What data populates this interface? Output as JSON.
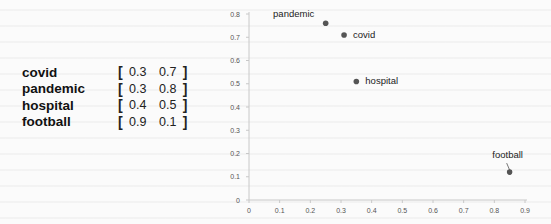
{
  "table": {
    "rows": [
      {
        "word": "covid",
        "open": "[",
        "v1": "0.3",
        "v2": "0.7",
        "close": "]"
      },
      {
        "word": "pandemic",
        "open": "[",
        "v1": "0.3",
        "v2": "0.8",
        "close": "]"
      },
      {
        "word": "hospital",
        "open": "[",
        "v1": "0.4",
        "v2": "0.5",
        "close": "]"
      },
      {
        "word": "football",
        "open": "[",
        "v1": "0.9",
        "v2": "0.1",
        "close": "]"
      }
    ]
  },
  "chart_data": {
    "type": "scatter",
    "title": "",
    "xlabel": "",
    "ylabel": "",
    "xlim": [
      0,
      0.9
    ],
    "ylim": [
      0,
      0.8
    ],
    "grid": false,
    "x_ticks": [
      "0",
      "0.1",
      "0.2",
      "0.3",
      "0.4",
      "0.5",
      "0.6",
      "0.7",
      "0.8",
      "0.9"
    ],
    "y_ticks": [
      "0",
      "0.1",
      "0.2",
      "0.3",
      "0.4",
      "0.5",
      "0.6",
      "0.7",
      "0.8"
    ],
    "points": [
      {
        "label": "pandemic",
        "x": 0.25,
        "y": 0.76
      },
      {
        "label": "covid",
        "x": 0.31,
        "y": 0.71
      },
      {
        "label": "hospital",
        "x": 0.35,
        "y": 0.51
      },
      {
        "label": "football",
        "x": 0.85,
        "y": 0.12
      }
    ],
    "point_color": "#555555"
  }
}
